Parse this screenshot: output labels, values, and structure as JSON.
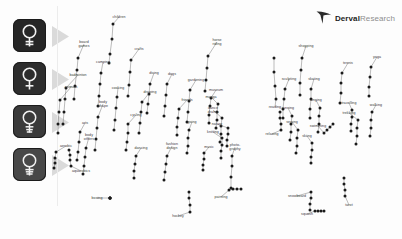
{
  "branding": {
    "logo_primary": "Derval",
    "logo_secondary": "Research",
    "logo_mark": "swoosh-bird-icon"
  },
  "legend_icons": [
    {
      "name": "venus-symbol-icon",
      "shade": "#262626"
    },
    {
      "name": "venus-symbol-icon",
      "shade": "#2d2d2d"
    },
    {
      "name": "venus-symbol-icon",
      "shade": "#3a3a3a"
    },
    {
      "name": "venus-symbol-icon",
      "shade": "#484848"
    }
  ],
  "chart_data": {
    "type": "scatter",
    "title": "",
    "xlabel": "",
    "ylabel": "",
    "grid": false,
    "legend_position": "left",
    "xlim": [
      60,
      400
    ],
    "ylim": [
      0,
      239
    ],
    "note": "Connected scatter: each interest label anchors a short vertical chain of markers across four female segments.",
    "series": [
      {
        "name": "segment-1",
        "marker": "filled-circle",
        "color": "#1a1a1a"
      },
      {
        "name": "segment-2",
        "marker": "filled-circle",
        "color": "#1a1a1a"
      },
      {
        "name": "segment-3",
        "marker": "filled-circle",
        "color": "#1a1a1a"
      },
      {
        "name": "segment-4",
        "marker": "filled-circle",
        "color": "#1a1a1a"
      }
    ],
    "points": [
      {
        "label": "children",
        "lx": 119,
        "ly": 17,
        "chain": [
          [
            113,
            24
          ],
          [
            112,
            39
          ],
          [
            110,
            54
          ],
          [
            109,
            63
          ]
        ]
      },
      {
        "label": "board\ngames",
        "lx": 84,
        "ly": 44,
        "chain": [
          [
            78,
            58
          ],
          [
            77,
            70
          ],
          [
            75,
            86
          ],
          [
            74,
            99
          ]
        ]
      },
      {
        "label": "camping",
        "lx": 103,
        "ly": 62,
        "chain": [
          [
            101,
            73
          ],
          [
            100,
            84
          ],
          [
            99,
            96
          ],
          [
            98,
            106
          ]
        ]
      },
      {
        "label": "badminton",
        "lx": 78,
        "ly": 75,
        "chain": [
          [
            66,
            88
          ],
          [
            65,
            99
          ],
          [
            64,
            112
          ],
          [
            63,
            124
          ]
        ]
      },
      {
        "label": "animals",
        "lx": 71,
        "ly": 87,
        "chain": [
          [
            60,
            100
          ],
          [
            59,
            112
          ],
          [
            58,
            124
          ],
          [
            58,
            133
          ]
        ]
      },
      {
        "label": "crafts",
        "lx": 139,
        "ly": 49,
        "chain": [
          [
            131,
            60
          ],
          [
            130,
            72
          ],
          [
            129,
            85
          ],
          [
            128,
            96
          ]
        ]
      },
      {
        "label": "cooking",
        "lx": 118,
        "ly": 88,
        "chain": [
          [
            117,
            97
          ],
          [
            116,
            108
          ],
          [
            115,
            120
          ],
          [
            114,
            130
          ]
        ]
      },
      {
        "label": "body\nshape",
        "lx": 103,
        "ly": 104,
        "chain": [
          [
            98,
            117
          ],
          [
            97,
            128
          ],
          [
            96,
            139
          ],
          [
            95,
            150
          ]
        ]
      },
      {
        "label": "arts",
        "lx": 85,
        "ly": 123,
        "chain": [
          [
            80,
            132
          ],
          [
            79,
            142
          ],
          [
            78,
            152
          ],
          [
            77,
            160
          ]
        ]
      },
      {
        "label": "body\nothers",
        "lx": 89,
        "ly": 137,
        "chain": [
          [
            86,
            148
          ],
          [
            85,
            157
          ],
          [
            84,
            166
          ],
          [
            83,
            174
          ]
        ]
      },
      {
        "label": "aerobic",
        "lx": 66,
        "ly": 146,
        "chain": [
          [
            56,
            152
          ],
          [
            55,
            158
          ],
          [
            55,
            163
          ],
          [
            54,
            168
          ]
        ]
      },
      {
        "label": "aquarobics",
        "lx": 81,
        "ly": 171,
        "chain": [
          [
            71,
            166
          ],
          [
            70,
            160
          ],
          [
            70,
            155
          ],
          [
            69,
            150
          ]
        ]
      },
      {
        "label": "boxing",
        "lx": 97,
        "ly": 198,
        "chain": [
          [
            110,
            198
          ],
          [
            110,
            198
          ],
          [
            110,
            198
          ],
          [
            110,
            198
          ]
        ]
      },
      {
        "label": "diving",
        "lx": 154,
        "ly": 73,
        "chain": [
          [
            150,
            84
          ],
          [
            149,
            94
          ],
          [
            148,
            104
          ],
          [
            147,
            113
          ]
        ]
      },
      {
        "label": "drawing",
        "lx": 150,
        "ly": 92,
        "chain": [
          [
            142,
            102
          ],
          [
            141,
            112
          ],
          [
            140,
            123
          ],
          [
            139,
            133
          ]
        ]
      },
      {
        "label": "dogs",
        "lx": 172,
        "ly": 74,
        "chain": [
          [
            167,
            84
          ],
          [
            166,
            95
          ],
          [
            165,
            106
          ],
          [
            164,
            116
          ]
        ]
      },
      {
        "label": "cycling",
        "lx": 136,
        "ly": 115,
        "chain": [
          [
            128,
            124
          ],
          [
            128,
            133
          ],
          [
            127,
            142
          ],
          [
            126,
            150
          ]
        ]
      },
      {
        "label": "dancing",
        "lx": 141,
        "ly": 148,
        "chain": [
          [
            136,
            156
          ],
          [
            135,
            164
          ],
          [
            134,
            171
          ],
          [
            134,
            178
          ]
        ]
      },
      {
        "label": "fashion\ndesign",
        "lx": 172,
        "ly": 146,
        "chain": [
          [
            167,
            156
          ],
          [
            166,
            164
          ],
          [
            165,
            172
          ],
          [
            164,
            180
          ]
        ]
      },
      {
        "label": "going",
        "lx": 192,
        "ly": 122,
        "chain": [
          [
            189,
            130
          ],
          [
            188,
            138
          ],
          [
            188,
            146
          ],
          [
            187,
            153
          ]
        ]
      },
      {
        "label": "gardening",
        "lx": 196,
        "ly": 80,
        "chain": [
          [
            190,
            90
          ],
          [
            189,
            101
          ],
          [
            188,
            112
          ],
          [
            187,
            122
          ]
        ]
      },
      {
        "label": "horse\nriding",
        "lx": 217,
        "ly": 42,
        "chain": [
          [
            208,
            56
          ],
          [
            207,
            68
          ],
          [
            206,
            80
          ],
          [
            205,
            91
          ]
        ]
      },
      {
        "label": "friends",
        "lx": 187,
        "ly": 100,
        "chain": [
          [
            179,
            109
          ],
          [
            178,
            118
          ],
          [
            177,
            127
          ],
          [
            177,
            135
          ]
        ]
      },
      {
        "label": "museum",
        "lx": 216,
        "ly": 90,
        "chain": [
          [
            211,
            98
          ],
          [
            210,
            106
          ],
          [
            209,
            115
          ],
          [
            209,
            123
          ]
        ]
      },
      {
        "label": "manga",
        "lx": 211,
        "ly": 97,
        "chain": [
          [
            218,
            104
          ],
          [
            217,
            112
          ],
          [
            217,
            120
          ],
          [
            216,
            128
          ]
        ]
      },
      {
        "label": "dance\ndrama",
        "lx": 213,
        "ly": 110,
        "chain": [
          [
            222,
            118
          ],
          [
            221,
            126
          ],
          [
            221,
            134
          ],
          [
            220,
            142
          ]
        ]
      },
      {
        "label": "nature",
        "lx": 217,
        "ly": 124,
        "chain": [
          [
            228,
            128
          ],
          [
            228,
            134
          ],
          [
            227,
            140
          ],
          [
            227,
            146
          ]
        ]
      },
      {
        "label": "knitting",
        "lx": 213,
        "ly": 132,
        "chain": [
          [
            222,
            138
          ],
          [
            222,
            145
          ],
          [
            221,
            151
          ],
          [
            221,
            158
          ]
        ]
      },
      {
        "label": "music",
        "lx": 209,
        "ly": 147,
        "chain": [
          [
            204,
            153
          ],
          [
            204,
            159
          ],
          [
            203,
            165
          ],
          [
            203,
            170
          ]
        ]
      },
      {
        "label": "photo-\ngraphy",
        "lx": 235,
        "ly": 147,
        "chain": [
          [
            232,
            156
          ],
          [
            232,
            166
          ],
          [
            231,
            177
          ],
          [
            231,
            188
          ]
        ]
      },
      {
        "label": "hockey",
        "lx": 178,
        "ly": 216,
        "chain": [
          [
            190,
            212
          ],
          [
            190,
            205
          ],
          [
            189,
            198
          ],
          [
            189,
            192
          ]
        ]
      },
      {
        "label": "painting",
        "lx": 221,
        "ly": 197,
        "chain": [
          [
            229,
            190
          ],
          [
            233,
            189
          ],
          [
            237,
            189
          ],
          [
            241,
            189
          ]
        ]
      },
      {
        "label": "reading",
        "lx": 275,
        "ly": 107,
        "chain": [
          [
            276,
            99
          ],
          [
            275,
            86
          ],
          [
            274,
            72
          ],
          [
            274,
            58
          ]
        ]
      },
      {
        "label": "relaxing",
        "lx": 272,
        "ly": 134,
        "chain": [
          [
            281,
            130
          ],
          [
            281,
            124
          ],
          [
            280,
            118
          ],
          [
            280,
            112
          ]
        ]
      },
      {
        "label": "sculpting",
        "lx": 289,
        "ly": 79,
        "chain": [
          [
            285,
            89
          ],
          [
            284,
            99
          ],
          [
            283,
            109
          ],
          [
            283,
            118
          ]
        ]
      },
      {
        "label": "running",
        "lx": 288,
        "ly": 108,
        "chain": [
          [
            292,
            116
          ],
          [
            291,
            124
          ],
          [
            291,
            132
          ],
          [
            290,
            140
          ]
        ]
      },
      {
        "label": "sewing",
        "lx": 292,
        "ly": 122,
        "chain": [
          [
            298,
            130
          ],
          [
            297,
            138
          ],
          [
            297,
            146
          ],
          [
            296,
            153
          ]
        ]
      },
      {
        "label": "shopping",
        "lx": 306,
        "ly": 46,
        "chain": [
          [
            302,
            58
          ],
          [
            301,
            70
          ],
          [
            300,
            83
          ],
          [
            300,
            95
          ]
        ]
      },
      {
        "label": "skating",
        "lx": 314,
        "ly": 79,
        "chain": [
          [
            311,
            89
          ],
          [
            311,
            99
          ],
          [
            310,
            109
          ],
          [
            310,
            118
          ]
        ]
      },
      {
        "label": "singing",
        "lx": 316,
        "ly": 100,
        "chain": [
          [
            320,
            108
          ],
          [
            319,
            116
          ],
          [
            319,
            124
          ],
          [
            318,
            132
          ]
        ]
      },
      {
        "label": "swimming",
        "lx": 318,
        "ly": 126,
        "chain": [
          [
            324,
            133
          ],
          [
            327,
            130
          ],
          [
            330,
            127
          ],
          [
            333,
            124
          ]
        ]
      },
      {
        "label": "skiing",
        "lx": 307,
        "ly": 136,
        "chain": [
          [
            312,
            143
          ],
          [
            312,
            150
          ],
          [
            311,
            157
          ],
          [
            311,
            163
          ]
        ]
      },
      {
        "label": "snowboard",
        "lx": 297,
        "ly": 196,
        "chain": [
          [
            311,
            192
          ],
          [
            311,
            198
          ],
          [
            310,
            204
          ],
          [
            310,
            210
          ]
        ]
      },
      {
        "label": "squash",
        "lx": 307,
        "ly": 214,
        "chain": [
          [
            315,
            211
          ],
          [
            318,
            211
          ],
          [
            321,
            211
          ],
          [
            324,
            211
          ]
        ]
      },
      {
        "label": "tarot",
        "lx": 349,
        "ly": 205,
        "chain": [
          [
            345,
            196
          ],
          [
            345,
            190
          ],
          [
            344,
            184
          ],
          [
            344,
            178
          ]
        ]
      },
      {
        "label": "tennis",
        "lx": 348,
        "ly": 63,
        "chain": [
          [
            342,
            73
          ],
          [
            341,
            83
          ],
          [
            341,
            93
          ],
          [
            340,
            103
          ]
        ]
      },
      {
        "label": "yoga",
        "lx": 377,
        "ly": 57,
        "chain": [
          [
            371,
            67
          ],
          [
            370,
            77
          ],
          [
            369,
            87
          ],
          [
            369,
            96
          ]
        ]
      },
      {
        "label": "travelling",
        "lx": 349,
        "ly": 103,
        "chain": [
          [
            352,
            110
          ],
          [
            352,
            117
          ],
          [
            351,
            124
          ],
          [
            351,
            131
          ]
        ]
      },
      {
        "label": "trekking",
        "lx": 349,
        "ly": 113,
        "chain": [
          [
            358,
            120
          ],
          [
            357,
            128
          ],
          [
            357,
            136
          ],
          [
            356,
            144
          ]
        ]
      },
      {
        "label": "walking",
        "lx": 376,
        "ly": 105,
        "chain": [
          [
            372,
            112
          ],
          [
            371,
            120
          ],
          [
            371,
            128
          ],
          [
            370,
            136
          ]
        ]
      }
    ]
  }
}
